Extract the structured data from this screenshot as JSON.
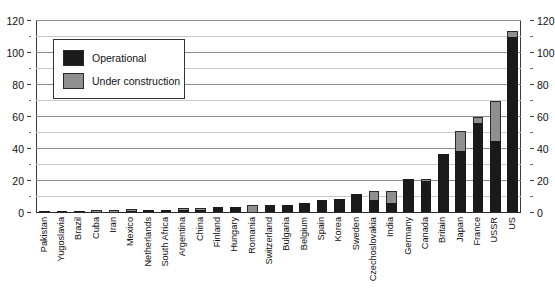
{
  "chart_data": {
    "type": "bar",
    "title": "",
    "subtitle": "",
    "xlabel": "",
    "ylabel": "",
    "ylim": [
      0,
      120
    ],
    "y_major_ticks": [
      0,
      20,
      40,
      60,
      80,
      100,
      120
    ],
    "y_minor_ticks": [
      10,
      30,
      50,
      70,
      90,
      110
    ],
    "grid": "horizontal",
    "stacked": true,
    "dual_y_axis": true,
    "legend_position": "upper-left-inside",
    "categories": [
      "Pakistan",
      "Yugoslavia",
      "Brazil",
      "Cuba",
      "Iran",
      "Mexico",
      "Netherlands",
      "South Africa",
      "Argentina",
      "China",
      "Finland",
      "Hungary",
      "Romania",
      "Switzerland",
      "Bulgaria",
      "Belgium",
      "Spain",
      "Korea",
      "Sweden",
      "Czechoslovakia",
      "India",
      "Germany",
      "Canada",
      "Britain",
      "Japan",
      "France",
      "USSR",
      "US"
    ],
    "series": [
      {
        "name": "Operational",
        "color": "#1a1a1a",
        "values": [
          1,
          1,
          1,
          0,
          0,
          1,
          2,
          2,
          2,
          2,
          4,
          4,
          0,
          5,
          5,
          6,
          8,
          9,
          12,
          8,
          6,
          21,
          20,
          37,
          39,
          56,
          45,
          110
        ]
      },
      {
        "name": "Under construction",
        "color": "#8f8f8f",
        "values": [
          0,
          0,
          0,
          2,
          2,
          1,
          0,
          0,
          1,
          1,
          0,
          0,
          5,
          0,
          0,
          0,
          0,
          0,
          0,
          6,
          8,
          0,
          1,
          0,
          12,
          4,
          25,
          4
        ]
      }
    ],
    "totals": [
      1,
      1,
      1,
      2,
      2,
      2,
      2,
      2,
      3,
      3,
      4,
      4,
      5,
      5,
      5,
      6,
      8,
      9,
      12,
      14,
      14,
      21,
      21,
      37,
      51,
      60,
      70,
      114
    ]
  },
  "legend": {
    "items": [
      {
        "label": "Operational",
        "swatch": "operational-swatch"
      },
      {
        "label": "Under construction",
        "swatch": "under-construction-swatch"
      }
    ]
  },
  "axis": {
    "left_labels": [
      "120",
      "100",
      "80",
      "60",
      "40",
      "20",
      "0"
    ],
    "right_labels": [
      "120",
      "100",
      "80",
      "60",
      "40",
      "20",
      "0"
    ]
  },
  "colors": {
    "operational": "#1a1a1a",
    "under_construction": "#8f8f8f",
    "grid_major": "#8d8d8d",
    "grid_minor": "#c9c9c9",
    "axis": "#3a3a3a",
    "background": "#ffffff"
  }
}
